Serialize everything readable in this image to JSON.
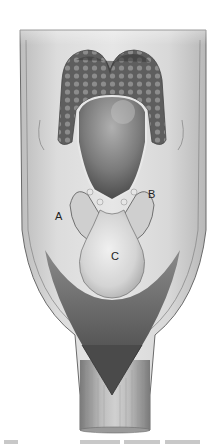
{
  "figure": {
    "labels": [
      {
        "id": "A",
        "text": "A",
        "x": 55,
        "y": 213
      },
      {
        "id": "B",
        "text": "B",
        "x": 148,
        "y": 191
      },
      {
        "id": "C",
        "text": "C",
        "x": 111,
        "y": 253
      }
    ],
    "colors": {
      "background": "#ffffff",
      "tissue_light": "#d9d9d9",
      "tissue_mid": "#a9a9a9",
      "tissue_dark": "#5a5a5a",
      "cavity_dark": "#3a3a3a",
      "outline": "#4d4d4d"
    }
  },
  "caption": {
    "text": ""
  }
}
